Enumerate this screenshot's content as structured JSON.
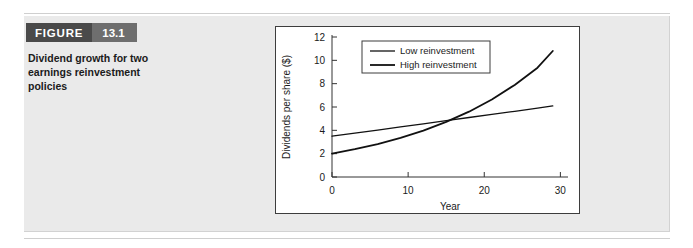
{
  "figure": {
    "badge_label": "FIGURE",
    "badge_number": "13.1",
    "caption_line_1": "Dividend growth for two",
    "caption_line_2": "earnings reinvestment",
    "caption_line_3": "policies",
    "caption_full": "Dividend growth for two earnings reinvestment policies",
    "badge_label_color": "#4a4a4a",
    "badge_number_color": "#6e6e6e",
    "panel_color": "#eaeaea"
  },
  "chart_data": {
    "type": "line",
    "title": "",
    "xlabel": "Year",
    "ylabel": "Dividends per share ($)",
    "xlim": [
      0,
      31
    ],
    "ylim": [
      0,
      12
    ],
    "xticks": [
      0,
      10,
      20,
      30
    ],
    "yticks": [
      0,
      2,
      4,
      6,
      8,
      10,
      12
    ],
    "xtick_labels": [
      "0",
      "10",
      "20",
      "30"
    ],
    "ytick_labels": [
      "0",
      "2",
      "4",
      "6",
      "8",
      "10",
      "12"
    ],
    "grid": false,
    "legend_position": "upper-center",
    "x": [
      0,
      3,
      6,
      9,
      12,
      15,
      18,
      21,
      24,
      27,
      29
    ],
    "series": [
      {
        "name": "Low reinvestment",
        "color": "#111111",
        "line_width": 1.3,
        "values": [
          3.5,
          3.76,
          4.02,
          4.29,
          4.56,
          4.83,
          5.1,
          5.37,
          5.63,
          5.9,
          6.1
        ]
      },
      {
        "name": "High reinvestment",
        "color": "#111111",
        "line_width": 1.8,
        "values": [
          2.0,
          2.38,
          2.82,
          3.35,
          3.98,
          4.72,
          5.6,
          6.65,
          7.89,
          9.37,
          10.8
        ]
      }
    ],
    "crossover": {
      "x": 14,
      "y": 4.62
    }
  }
}
